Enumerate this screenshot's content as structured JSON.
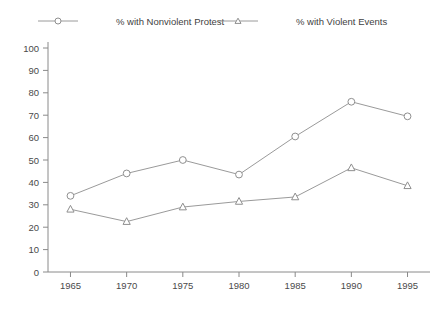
{
  "chart_data": {
    "type": "line",
    "title": "",
    "subtitle": "",
    "xlabel": "",
    "ylabel": "",
    "x": [
      1965,
      1970,
      1975,
      1980,
      1985,
      1990,
      1995
    ],
    "categories": [
      "1965",
      "1970",
      "1975",
      "1980",
      "1985",
      "1990",
      "1995"
    ],
    "xlim": [
      1963,
      1997
    ],
    "ylim": [
      0,
      100
    ],
    "yticks": [
      0,
      10,
      20,
      30,
      40,
      50,
      60,
      70,
      80,
      90,
      100
    ],
    "ytick_labels": [
      "0",
      "10",
      "20",
      "30",
      "40",
      "50",
      "60",
      "70",
      "80",
      "90",
      "100"
    ],
    "xticks": [
      1965,
      1970,
      1975,
      1980,
      1985,
      1990,
      1995
    ],
    "xtick_labels": [
      "1965",
      "1970",
      "1975",
      "1980",
      "1985",
      "1990",
      "1995"
    ],
    "grid": false,
    "legend_position": "top",
    "series": [
      {
        "name": "% with Nonviolent Protest",
        "marker": "circle",
        "color": "#9a9a9a",
        "values": [
          34,
          44,
          50,
          43.5,
          60.5,
          76,
          69.5
        ]
      },
      {
        "name": "% with Violent Events",
        "marker": "triangle",
        "color": "#9a9a9a",
        "values": [
          28,
          22.5,
          29,
          31.5,
          33.5,
          46.5,
          38.5
        ]
      }
    ]
  },
  "legend": {
    "items": [
      {
        "label": "% with Nonviolent Protest",
        "marker": "circle"
      },
      {
        "label": "% with Violent Events",
        "marker": "triangle"
      }
    ]
  },
  "colors": {
    "line": "#9a9a9a",
    "axis": "#8a8a8a",
    "marker_stroke": "#8f8f8f",
    "marker_fill": "#ffffff",
    "text": "#3f3f3f",
    "background": "#ffffff"
  }
}
